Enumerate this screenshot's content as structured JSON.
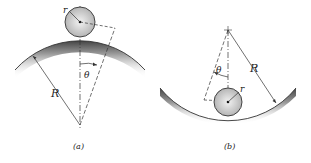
{
  "figures": [
    {
      "id": "a",
      "caption": "(a)",
      "labels": {
        "small_radius": "r",
        "large_radius": "R",
        "angle": "θ"
      },
      "description": "Disk of radius r rolling on top of a convex cylindrical surface of radius R"
    },
    {
      "id": "b",
      "caption": "(b)",
      "labels": {
        "small_radius": "r",
        "large_radius": "R",
        "angle": "θ"
      },
      "description": "Disk of radius r rolling inside a concave cylindrical surface of radius R"
    }
  ],
  "colors": {
    "stroke": "#333333",
    "surface_dark": "#555555",
    "surface_light": "#f4f4f4",
    "disk_fill": "#c8c8c8"
  }
}
